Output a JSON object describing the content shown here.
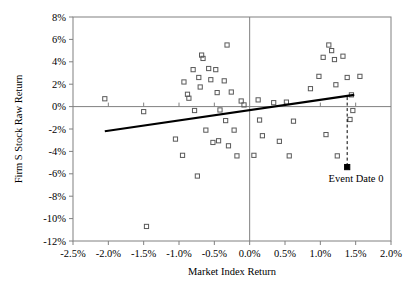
{
  "chart_data": {
    "type": "scatter",
    "title": "",
    "xlabel": "Market Index Return",
    "ylabel": "Firm S Stock Raw Return",
    "xlim": [
      -2.5,
      2.0
    ],
    "ylim": [
      -12,
      8
    ],
    "xticks": [
      "-2.5%",
      "-2.0%",
      "-1.5%",
      "-1.0%",
      "-0.5%",
      "0.0%",
      "0.5%",
      "1.0%",
      "1.5%",
      "2.0%"
    ],
    "xtick_values": [
      -2.5,
      -2.0,
      -1.5,
      -1.0,
      -0.5,
      0.0,
      0.5,
      1.0,
      1.5,
      2.0
    ],
    "yticks": [
      "8%",
      "6%",
      "4%",
      "2%",
      "0%",
      "-2%",
      "-4%",
      "-6%",
      "-8%",
      "-10%",
      "-12%"
    ],
    "ytick_values": [
      8,
      6,
      4,
      2,
      0,
      -2,
      -4,
      -6,
      -8,
      -10,
      -12
    ],
    "grid": false,
    "legend": "none",
    "zero_lines": {
      "x": 0.0,
      "y": 0
    },
    "marker": "open-square",
    "points": [
      {
        "x": -2.05,
        "y": 0.7
      },
      {
        "x": -1.46,
        "y": -10.7
      },
      {
        "x": -1.5,
        "y": -0.45
      },
      {
        "x": -1.05,
        "y": -2.9
      },
      {
        "x": -0.95,
        "y": -4.35
      },
      {
        "x": -0.93,
        "y": 2.2
      },
      {
        "x": -0.88,
        "y": 1.1
      },
      {
        "x": -0.86,
        "y": 0.75
      },
      {
        "x": -0.8,
        "y": 3.3
      },
      {
        "x": -0.78,
        "y": -0.35
      },
      {
        "x": -0.74,
        "y": -6.2
      },
      {
        "x": -0.72,
        "y": 2.6
      },
      {
        "x": -0.7,
        "y": 1.75
      },
      {
        "x": -0.68,
        "y": 4.6
      },
      {
        "x": -0.66,
        "y": 4.3
      },
      {
        "x": -0.62,
        "y": -2.1
      },
      {
        "x": -0.58,
        "y": 3.4
      },
      {
        "x": -0.55,
        "y": 2.4
      },
      {
        "x": -0.52,
        "y": -3.2
      },
      {
        "x": -0.48,
        "y": 3.3
      },
      {
        "x": -0.46,
        "y": 1.25
      },
      {
        "x": -0.44,
        "y": -3.05
      },
      {
        "x": -0.42,
        "y": -0.3
      },
      {
        "x": -0.36,
        "y": 2.3
      },
      {
        "x": -0.34,
        "y": -1.25
      },
      {
        "x": -0.32,
        "y": 5.5
      },
      {
        "x": -0.3,
        "y": -3.5
      },
      {
        "x": -0.26,
        "y": 1.3
      },
      {
        "x": -0.22,
        "y": -2.1
      },
      {
        "x": -0.18,
        "y": -4.4
      },
      {
        "x": -0.12,
        "y": 0.5
      },
      {
        "x": -0.08,
        "y": 0.15
      },
      {
        "x": 0.06,
        "y": -4.35
      },
      {
        "x": 0.12,
        "y": 0.6
      },
      {
        "x": 0.14,
        "y": -1.2
      },
      {
        "x": 0.18,
        "y": -2.6
      },
      {
        "x": 0.34,
        "y": 0.35
      },
      {
        "x": 0.42,
        "y": -3.1
      },
      {
        "x": 0.52,
        "y": 0.4
      },
      {
        "x": 0.56,
        "y": -4.4
      },
      {
        "x": 0.62,
        "y": -1.3
      },
      {
        "x": 0.86,
        "y": 1.6
      },
      {
        "x": 0.98,
        "y": 2.7
      },
      {
        "x": 1.04,
        "y": 4.4
      },
      {
        "x": 1.08,
        "y": -2.5
      },
      {
        "x": 1.12,
        "y": 5.5
      },
      {
        "x": 1.16,
        "y": 5.0
      },
      {
        "x": 1.2,
        "y": 4.2
      },
      {
        "x": 1.22,
        "y": 1.95
      },
      {
        "x": 1.24,
        "y": -4.4
      },
      {
        "x": 1.32,
        "y": 4.5
      },
      {
        "x": 1.38,
        "y": 2.6
      },
      {
        "x": 1.42,
        "y": -1.15
      },
      {
        "x": 1.44,
        "y": 1.05
      },
      {
        "x": 1.46,
        "y": -0.35
      },
      {
        "x": 1.56,
        "y": 2.7
      }
    ],
    "regression_line": {
      "x1": -2.05,
      "y1": -2.2,
      "x2": 1.48,
      "y2": 1.05
    },
    "event_point": {
      "x": 1.38,
      "y": -5.4,
      "marker": "filled-square",
      "label": "Event Date 0",
      "dropline_to_y": 0.85
    }
  },
  "colors": {
    "axis": "#808080",
    "marker_stroke": "#595959",
    "regression": "#000000",
    "event": "#000000",
    "background": "#ffffff"
  }
}
